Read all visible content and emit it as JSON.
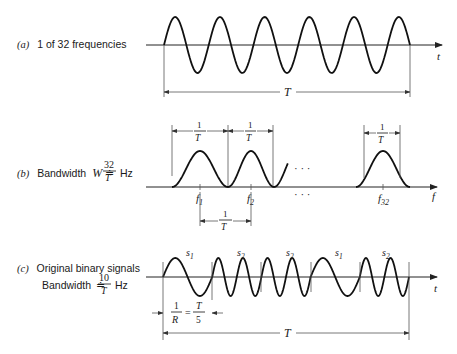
{
  "panel_a": {
    "tag": "(a)",
    "label": "1 of 32 frequencies",
    "axis_label": "t",
    "span_label": "T"
  },
  "panel_b": {
    "tag": "(b)",
    "label_prefix": "Bandwidth",
    "label_var": "W",
    "label_approx": "≐",
    "label_num": "32",
    "label_den": "T",
    "label_unit": "Hz",
    "axis_label": "f",
    "width_num": "1",
    "width_den": "T",
    "freq_labels": [
      {
        "base": "f",
        "sub": "1"
      },
      {
        "base": "f",
        "sub": "2"
      },
      {
        "base": "f",
        "sub": "32"
      }
    ],
    "ellipsis": "· · ·",
    "spacing_num": "1",
    "spacing_den": "T"
  },
  "panel_c": {
    "tag": "(c)",
    "label_line1": "Original binary signals",
    "label_prefix": "Bandwidth",
    "label_approx": "≐",
    "label_num": "10",
    "label_den": "T",
    "label_unit": "Hz",
    "axis_label": "t",
    "symbols": [
      {
        "base": "s",
        "sub": "1"
      },
      {
        "base": "s",
        "sub": "2"
      },
      {
        "base": "s",
        "sub": "2"
      },
      {
        "base": "s",
        "sub": "1"
      },
      {
        "base": "s",
        "sub": "2"
      }
    ],
    "bit_num": "1",
    "bit_den": "R",
    "bit_eq": "=",
    "bit_rhs_num": "T",
    "bit_rhs_den": "5",
    "span_label": "T"
  }
}
